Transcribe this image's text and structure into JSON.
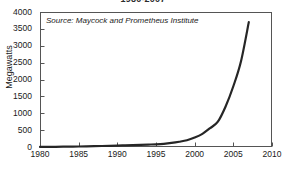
{
  "chart_data": {
    "type": "line",
    "title": "1980-2007",
    "xlabel": "",
    "ylabel": "Megawatts",
    "xlim": [
      1980,
      2010
    ],
    "ylim": [
      0,
      4000
    ],
    "grid": false,
    "legend": "none",
    "annotation": "Source: Maycock and Prometheus Institute",
    "line_color": "#262626",
    "axis_color": "#555555",
    "background": "#ffffff",
    "xticks": [
      "1980",
      "1985",
      "1990",
      "1995",
      "2000",
      "2005",
      "2010"
    ],
    "xtick_values": [
      1980,
      1985,
      1990,
      1995,
      2000,
      2005,
      2010
    ],
    "yticks": [
      "0",
      "500",
      "1000",
      "1500",
      "2000",
      "2500",
      "3000",
      "3500",
      "4000"
    ],
    "ytick_values": [
      0,
      500,
      1000,
      1500,
      2000,
      2500,
      3000,
      3500,
      4000
    ],
    "series": [
      {
        "name": "Solar PV production",
        "x": [
          1980,
          1981,
          1982,
          1983,
          1984,
          1985,
          1986,
          1987,
          1988,
          1989,
          1990,
          1991,
          1992,
          1993,
          1994,
          1995,
          1996,
          1997,
          1998,
          1999,
          2000,
          2001,
          2002,
          2003,
          2004,
          2005,
          2006,
          2007
        ],
        "values": [
          2,
          4,
          6,
          9,
          12,
          15,
          20,
          25,
          30,
          35,
          40,
          48,
          56,
          64,
          72,
          80,
          95,
          120,
          155,
          200,
          280,
          390,
          560,
          750,
          1200,
          1800,
          2550,
          3700
        ]
      }
    ]
  }
}
